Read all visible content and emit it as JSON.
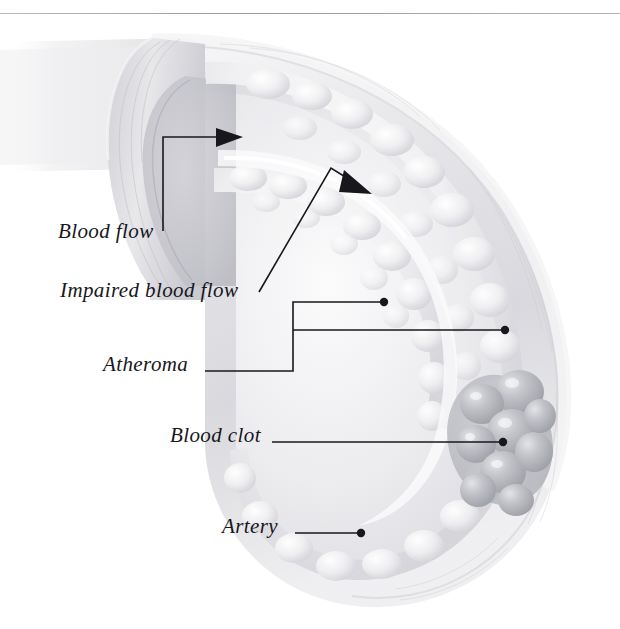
{
  "figure": {
    "title_rule": "horizontal-divider",
    "background_color": "#ffffff",
    "ink_color": "#17171c"
  },
  "labels": [
    {
      "id": "blood-flow",
      "text": "Blood flow",
      "x": 58,
      "y": 238,
      "connector": "arrow-right",
      "dot": false
    },
    {
      "id": "impaired-blood-flow",
      "text": "Impaired blood flow",
      "x": 60,
      "y": 297,
      "connector": "arrow-diagonal",
      "dot": false
    },
    {
      "id": "atheroma",
      "text": "Atheroma",
      "x": 103,
      "y": 371,
      "connector": "bracket-two-dots",
      "dot": true
    },
    {
      "id": "blood-clot",
      "text": "Blood clot",
      "x": 170,
      "y": 442,
      "connector": "leader-dot",
      "dot": true
    },
    {
      "id": "artery",
      "text": "Artery",
      "x": 222,
      "y": 533,
      "connector": "leader-dot",
      "dot": true
    }
  ],
  "anatomy": {
    "artery_label": "Artery",
    "atheroma_label": "Atheroma",
    "clot_label": "Blood clot",
    "lumen_color": "#e8e8ea",
    "wall_color": "#dcdce0",
    "plaque_color": "#f2f2f4",
    "clot_color": "#b9bbc0"
  },
  "leaders": {
    "blood_flow": {
      "from": [
        163,
        231
      ],
      "elbow": [
        163,
        137
      ],
      "to": [
        228,
        137
      ]
    },
    "impaired_flow": {
      "from": [
        259,
        291
      ],
      "elbow": [
        330,
        168
      ],
      "to": [
        368,
        192
      ]
    },
    "atheroma": {
      "stem_from": [
        205,
        371
      ],
      "spine_x": 293,
      "branch_top_y": 302,
      "branch_top_x": 384,
      "branch_mid_y": 330,
      "branch_mid_x": 505,
      "corner_y": 371
    },
    "blood_clot": {
      "from": [
        272,
        442
      ],
      "to": [
        503,
        442
      ]
    },
    "artery": {
      "from": [
        295,
        533
      ],
      "to": [
        361,
        533
      ]
    }
  }
}
